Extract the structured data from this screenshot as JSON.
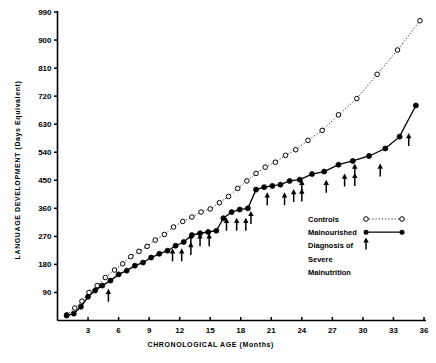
{
  "chart_data": {
    "type": "line",
    "title": "",
    "xlabel": "CHRONOLOGICAL AGE (Months)",
    "ylabel": "LANGUAGE DEVELOPMENT (Days Equivalent)",
    "xlim": [
      0,
      36
    ],
    "ylim": [
      0,
      990
    ],
    "xticks": [
      3,
      6,
      9,
      12,
      15,
      18,
      21,
      24,
      27,
      30,
      33,
      36
    ],
    "yticks": [
      90,
      180,
      270,
      360,
      450,
      540,
      630,
      720,
      810,
      900,
      990
    ],
    "grid": false,
    "legend_position": "right-middle",
    "series": [
      {
        "name": "Controls",
        "marker": "open-circle",
        "linestyle": "dotted",
        "color": "#000000",
        "points": [
          {
            "x": 0.9,
            "y": 18
          },
          {
            "x": 1.7,
            "y": 40
          },
          {
            "x": 2.4,
            "y": 62
          },
          {
            "x": 3.1,
            "y": 90
          },
          {
            "x": 3.9,
            "y": 112
          },
          {
            "x": 4.7,
            "y": 138
          },
          {
            "x": 5.6,
            "y": 162
          },
          {
            "x": 6.4,
            "y": 182
          },
          {
            "x": 7.2,
            "y": 205
          },
          {
            "x": 8.0,
            "y": 222
          },
          {
            "x": 8.8,
            "y": 238
          },
          {
            "x": 9.6,
            "y": 258
          },
          {
            "x": 10.5,
            "y": 276
          },
          {
            "x": 11.4,
            "y": 300
          },
          {
            "x": 12.3,
            "y": 318
          },
          {
            "x": 13.2,
            "y": 332
          },
          {
            "x": 14.1,
            "y": 348
          },
          {
            "x": 15.0,
            "y": 358
          },
          {
            "x": 15.9,
            "y": 378
          },
          {
            "x": 16.8,
            "y": 398
          },
          {
            "x": 17.7,
            "y": 424
          },
          {
            "x": 18.6,
            "y": 448
          },
          {
            "x": 19.5,
            "y": 472
          },
          {
            "x": 20.4,
            "y": 492
          },
          {
            "x": 21.4,
            "y": 508
          },
          {
            "x": 22.4,
            "y": 530
          },
          {
            "x": 23.4,
            "y": 548
          },
          {
            "x": 24.6,
            "y": 578
          },
          {
            "x": 26.0,
            "y": 610
          },
          {
            "x": 27.6,
            "y": 660
          },
          {
            "x": 29.4,
            "y": 712
          },
          {
            "x": 31.4,
            "y": 790
          },
          {
            "x": 33.4,
            "y": 868
          },
          {
            "x": 35.6,
            "y": 962
          }
        ]
      },
      {
        "name": "Malnourished",
        "marker": "filled-circle",
        "linestyle": "solid",
        "color": "#000000",
        "points": [
          {
            "x": 0.9,
            "y": 16
          },
          {
            "x": 1.6,
            "y": 22
          },
          {
            "x": 2.3,
            "y": 44
          },
          {
            "x": 3.0,
            "y": 76
          },
          {
            "x": 3.7,
            "y": 96
          },
          {
            "x": 4.4,
            "y": 112
          },
          {
            "x": 5.2,
            "y": 128
          },
          {
            "x": 6.0,
            "y": 148
          },
          {
            "x": 6.8,
            "y": 160
          },
          {
            "x": 7.6,
            "y": 176
          },
          {
            "x": 8.4,
            "y": 186
          },
          {
            "x": 9.2,
            "y": 202
          },
          {
            "x": 10.0,
            "y": 214
          },
          {
            "x": 10.8,
            "y": 224
          },
          {
            "x": 11.6,
            "y": 240
          },
          {
            "x": 12.4,
            "y": 252
          },
          {
            "x": 13.2,
            "y": 274
          },
          {
            "x": 14.0,
            "y": 280
          },
          {
            "x": 14.8,
            "y": 284
          },
          {
            "x": 15.6,
            "y": 288
          },
          {
            "x": 16.3,
            "y": 328
          },
          {
            "x": 17.1,
            "y": 348
          },
          {
            "x": 17.9,
            "y": 356
          },
          {
            "x": 18.7,
            "y": 360
          },
          {
            "x": 19.5,
            "y": 420
          },
          {
            "x": 20.3,
            "y": 428
          },
          {
            "x": 21.1,
            "y": 432
          },
          {
            "x": 21.9,
            "y": 436
          },
          {
            "x": 22.8,
            "y": 448
          },
          {
            "x": 23.8,
            "y": 452
          },
          {
            "x": 25.0,
            "y": 470
          },
          {
            "x": 26.2,
            "y": 478
          },
          {
            "x": 27.6,
            "y": 500
          },
          {
            "x": 29.0,
            "y": 512
          },
          {
            "x": 30.6,
            "y": 528
          },
          {
            "x": 32.2,
            "y": 552
          },
          {
            "x": 33.6,
            "y": 590
          },
          {
            "x": 35.2,
            "y": 690
          }
        ]
      }
    ],
    "annotations": {
      "name": "Diagnosis of Severe Malnutrition",
      "marker": "up-arrow",
      "arrows": [
        {
          "x": 5.0,
          "y": 60
        },
        {
          "x": 11.3,
          "y": 190
        },
        {
          "x": 12.2,
          "y": 190
        },
        {
          "x": 13.1,
          "y": 210
        },
        {
          "x": 13.1,
          "y": 238
        },
        {
          "x": 14.0,
          "y": 238
        },
        {
          "x": 14.9,
          "y": 238
        },
        {
          "x": 16.6,
          "y": 288
        },
        {
          "x": 17.6,
          "y": 288
        },
        {
          "x": 18.5,
          "y": 288
        },
        {
          "x": 19.0,
          "y": 310
        },
        {
          "x": 20.6,
          "y": 370
        },
        {
          "x": 22.3,
          "y": 370
        },
        {
          "x": 23.2,
          "y": 380
        },
        {
          "x": 24.0,
          "y": 382
        },
        {
          "x": 24.0,
          "y": 410
        },
        {
          "x": 26.4,
          "y": 410
        },
        {
          "x": 28.2,
          "y": 430
        },
        {
          "x": 29.2,
          "y": 432
        },
        {
          "x": 29.2,
          "y": 462
        },
        {
          "x": 31.7,
          "y": 462
        },
        {
          "x": 34.5,
          "y": 560
        }
      ]
    }
  },
  "legend": {
    "items": [
      {
        "label": "Controls",
        "symbol": "open-circle-dotted"
      },
      {
        "label": "Malnourished",
        "symbol": "filled-circle-solid"
      },
      {
        "label": "Diagnosis of",
        "symbol": "up-arrow"
      },
      {
        "label": "Severe",
        "symbol": ""
      },
      {
        "label": "Malnutrition",
        "symbol": ""
      }
    ]
  }
}
